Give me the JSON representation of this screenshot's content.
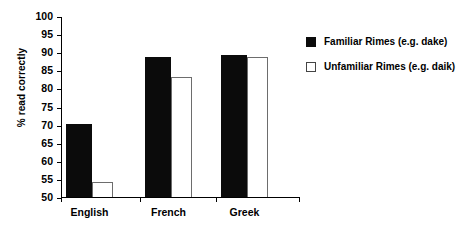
{
  "chart_data": {
    "type": "bar",
    "title": "",
    "xlabel": "",
    "ylabel": "% read correctly",
    "ylim": [
      50,
      100
    ],
    "ytick_step": 5,
    "yticks": [
      50,
      55,
      60,
      65,
      70,
      75,
      80,
      85,
      90,
      95,
      100
    ],
    "grid": false,
    "legend_position": "right",
    "categories": [
      "English",
      "French",
      "Greek"
    ],
    "series": [
      {
        "name": "Familiar Rimes (e.g. dake)",
        "values": [
          70.5,
          89.0,
          89.5
        ],
        "color": "#0b0b0b",
        "style": "filled"
      },
      {
        "name": "Unfamiliar Rimes (e.g. daik)",
        "values": [
          54.5,
          83.5,
          89.0
        ],
        "color": "#ffffff",
        "style": "outlined"
      }
    ]
  },
  "axis": {
    "y_title": "% read correctly",
    "y_labels": [
      "100",
      "95",
      "90",
      "85",
      "80",
      "75",
      "70",
      "65",
      "60",
      "55",
      "50"
    ],
    "x_labels": [
      "English",
      "French",
      "Greek"
    ]
  },
  "legend": {
    "items": [
      {
        "label": "Familiar Rimes (e.g. dake)",
        "swatch": "filled-square"
      },
      {
        "label": "Unfamiliar Rimes (e.g. daik)",
        "swatch": "hollow-square"
      }
    ]
  }
}
